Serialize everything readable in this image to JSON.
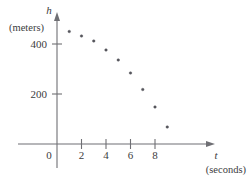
{
  "chart_data": {
    "type": "scatter",
    "title": "",
    "subtitle": "",
    "xlabel": "t",
    "xunit": "(seconds)",
    "ylabel": "h",
    "yunit": "(meters)",
    "x": [
      1,
      2,
      3,
      4,
      5,
      6,
      7,
      8,
      9
    ],
    "values": [
      450,
      432,
      412,
      376,
      336,
      284,
      218,
      148,
      68
    ],
    "series": [
      {
        "name": "height",
        "points": [
          {
            "t": 1,
            "h": 450
          },
          {
            "t": 2,
            "h": 432
          },
          {
            "t": 3,
            "h": 412
          },
          {
            "t": 4,
            "h": 376
          },
          {
            "t": 5,
            "h": 336
          },
          {
            "t": 6,
            "h": 284
          },
          {
            "t": 7,
            "h": 218
          },
          {
            "t": 8,
            "h": 148
          },
          {
            "t": 9,
            "h": 68
          }
        ]
      }
    ],
    "xlim": [
      -1.2,
      11.0
    ],
    "ylim": [
      -60,
      520
    ],
    "xticks": [
      2,
      4,
      6,
      8
    ],
    "xticklabels": [
      "2",
      "4",
      "6",
      "8"
    ],
    "yticks": [
      200,
      400
    ],
    "yticklabels": [
      "200",
      "400"
    ],
    "origin_label": "0",
    "grid": false,
    "legend": "none",
    "marker": "dot",
    "point_color": "#55555c",
    "axis_color": "#6f6f74"
  },
  "axes": {
    "x_axis_name": "t",
    "x_axis_unit": "(seconds)",
    "y_axis_name": "h",
    "y_axis_unit": "(meters)",
    "origin": "0"
  },
  "tick_labels": {
    "x": [
      "2",
      "4",
      "6",
      "8"
    ],
    "y": [
      "200",
      "400"
    ]
  }
}
